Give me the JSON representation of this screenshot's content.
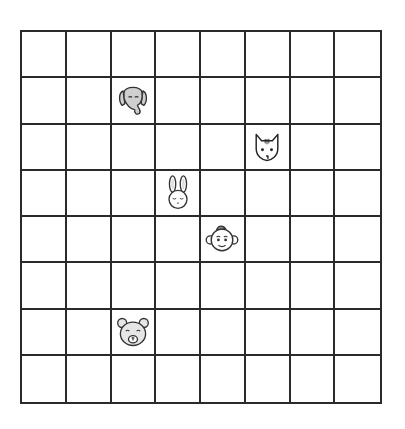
{
  "board": {
    "columns": 8,
    "rows": 8,
    "line_color": "#2a2a2a",
    "cell_color": "#ffffff"
  },
  "pieces": [
    {
      "animal": "elephant",
      "icon": "elephant-icon",
      "col": 2,
      "row": 1,
      "fill": "#cfcfcf"
    },
    {
      "animal": "cat",
      "icon": "cat-icon",
      "col": 5,
      "row": 2,
      "fill": "#ffffff"
    },
    {
      "animal": "rabbit",
      "icon": "rabbit-icon",
      "col": 3,
      "row": 3,
      "fill": "#ffffff"
    },
    {
      "animal": "monkey",
      "icon": "monkey-icon",
      "col": 4,
      "row": 4,
      "fill": "#ffffff"
    },
    {
      "animal": "bear",
      "icon": "bear-icon",
      "col": 2,
      "row": 6,
      "fill": "#e6e6e6"
    }
  ]
}
